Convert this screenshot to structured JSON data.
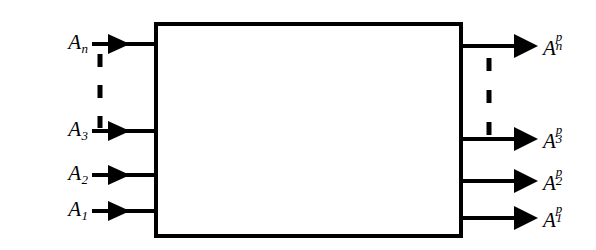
{
  "figure": {
    "type": "block-diagram",
    "background_color": "#ffffff",
    "stroke_color": "#000000"
  },
  "block": {
    "label": "",
    "x": 154,
    "y": 22,
    "width": 309,
    "height": 216,
    "border_width": 4,
    "fill": "#ffffff"
  },
  "inputs": [
    {
      "id": "input-n",
      "base": "A",
      "sub": "n",
      "sup": "",
      "y": 44,
      "label_x": 88,
      "arrow_tip_x": 128,
      "line_start_x": 92,
      "line_end_x": 156
    },
    {
      "id": "input-3",
      "base": "A",
      "sub": "3",
      "sup": "",
      "y": 131,
      "label_x": 88,
      "arrow_tip_x": 128,
      "line_start_x": 92,
      "line_end_x": 156
    },
    {
      "id": "input-2",
      "base": "A",
      "sub": "2",
      "sup": "",
      "y": 175,
      "label_x": 88,
      "arrow_tip_x": 128,
      "line_start_x": 92,
      "line_end_x": 156
    },
    {
      "id": "input-1",
      "base": "A",
      "sub": "1",
      "sup": "",
      "y": 211,
      "label_x": 88,
      "arrow_tip_x": 128,
      "line_start_x": 92,
      "line_end_x": 156
    }
  ],
  "outputs": [
    {
      "id": "output-n",
      "base": "A",
      "sub": "n",
      "sup": "p",
      "y": 46,
      "label_x": 543,
      "arrow_tip_x": 536,
      "line_start_x": 461,
      "line_end_x": 520
    },
    {
      "id": "output-3",
      "base": "A",
      "sub": "3",
      "sup": "p",
      "y": 139,
      "label_x": 543,
      "arrow_tip_x": 536,
      "line_start_x": 461,
      "line_end_x": 520
    },
    {
      "id": "output-2",
      "base": "A",
      "sub": "2",
      "sup": "p",
      "y": 181,
      "label_x": 543,
      "arrow_tip_x": 536,
      "line_start_x": 461,
      "line_end_x": 520
    },
    {
      "id": "output-1",
      "base": "A",
      "sub": "1",
      "sup": "p",
      "y": 218,
      "label_x": 543,
      "arrow_tip_x": 536,
      "line_start_x": 461,
      "line_end_x": 520
    }
  ],
  "ellipses": [
    {
      "id": "ellipsis-left",
      "orientation": "vertical",
      "x": 100,
      "y_start": 52,
      "y_end": 128,
      "dash_count": 3,
      "stroke_width": 5
    },
    {
      "id": "ellipsis-right",
      "orientation": "vertical",
      "x": 489,
      "y_start": 56,
      "y_end": 136,
      "dash_count": 3,
      "stroke_width": 5
    }
  ]
}
